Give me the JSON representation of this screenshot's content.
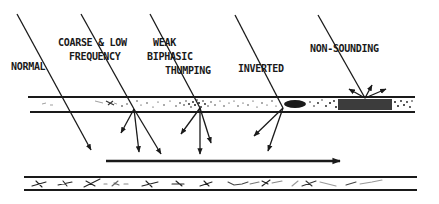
{
  "diagram": {
    "type": "wave-reflection-schematic",
    "labels": {
      "normal": "NORMAL",
      "coarse_line1": "COARSE & LOW",
      "coarse_line2": "FREQUENCY",
      "weak_line1": "WEAK",
      "weak_line2": "BIPHASIC",
      "weak_line3": "THUMPING",
      "inverted": "INVERTED",
      "non_sounding": "NON-SOUNDING"
    },
    "colors": {
      "ink": "#1a1a1a",
      "background": "#ffffff"
    },
    "cases": [
      {
        "id": "normal",
        "label": "NORMAL",
        "reflection": "none (passes through)"
      },
      {
        "id": "coarse",
        "label": "COARSE & LOW FREQUENCY",
        "reflection": "scattered downward"
      },
      {
        "id": "weak",
        "label": "WEAK BIPHASIC THUMPING",
        "reflection": "scattered downward"
      },
      {
        "id": "inverted",
        "label": "INVERTED",
        "reflection": "scattered downward"
      },
      {
        "id": "non_sounding",
        "label": "NON-SOUNDING",
        "reflection": "scattered upward"
      }
    ],
    "direction_arrow": "left-to-right"
  }
}
